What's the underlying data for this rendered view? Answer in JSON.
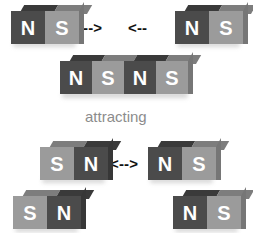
{
  "figure": {
    "background_color": "#ffffff"
  },
  "colors": {
    "pole_dark": "#4b4b4b",
    "pole_light": "#9b9b9b",
    "top_dark": "#3a3a3a",
    "top_light": "#7d7d7d",
    "side_dark": "#373737",
    "side_light": "#767676",
    "label_text": "#ffffff",
    "arrow": "#111111",
    "caption": "#8c8c8c"
  },
  "labels": {
    "north": "N",
    "south": "S"
  },
  "caption": {
    "attracting": "attracting"
  },
  "arrows": {
    "toward_right": "- - >",
    "toward_left": "< - -",
    "apart": "< - - >"
  },
  "scenes": [
    {
      "name": "attracting",
      "caption": "attracting",
      "rows": [
        {
          "name": "approaching-magnets",
          "magnets": [
            {
              "name": "top-left-magnet",
              "poles": [
                "N",
                "S"
              ],
              "shades": [
                "dark",
                "light"
              ]
            },
            {
              "name": "top-right-magnet",
              "poles": [
                "N",
                "S"
              ],
              "shades": [
                "dark",
                "light"
              ]
            }
          ],
          "arrows": [
            "- - >",
            "< - -"
          ]
        },
        {
          "name": "joined-magnets",
          "magnets": [
            {
              "name": "joined-magnet",
              "poles": [
                "N",
                "S",
                "N",
                "S"
              ],
              "shades": [
                "dark",
                "light",
                "dark",
                "light"
              ]
            }
          ],
          "arrows": []
        }
      ]
    },
    {
      "name": "repelling",
      "caption": "",
      "rows": [
        {
          "name": "separating-magnets",
          "magnets": [
            {
              "name": "mid-left-magnet",
              "poles": [
                "S",
                "N"
              ],
              "shades": [
                "light",
                "dark"
              ]
            },
            {
              "name": "mid-right-magnet",
              "poles": [
                "N",
                "S"
              ],
              "shades": [
                "dark",
                "light"
              ]
            }
          ],
          "arrows": [
            "< - - >"
          ]
        },
        {
          "name": "separated-magnets",
          "magnets": [
            {
              "name": "bottom-left-magnet",
              "poles": [
                "S",
                "N"
              ],
              "shades": [
                "light",
                "dark"
              ]
            },
            {
              "name": "bottom-right-magnet",
              "poles": [
                "N",
                "S"
              ],
              "shades": [
                "dark",
                "light"
              ]
            }
          ],
          "arrows": []
        }
      ]
    }
  ]
}
